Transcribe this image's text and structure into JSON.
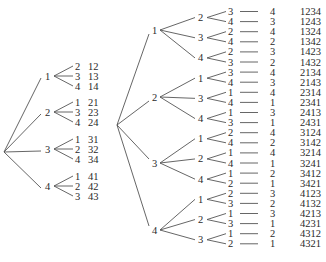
{
  "tree2": {
    "root_children": [
      {
        "label": "1",
        "children": [
          {
            "label": "2",
            "leaf": "12"
          },
          {
            "label": "3",
            "leaf": "13"
          },
          {
            "label": "4",
            "leaf": "14"
          }
        ]
      },
      {
        "label": "2",
        "children": [
          {
            "label": "1",
            "leaf": "21"
          },
          {
            "label": "3",
            "leaf": "23"
          },
          {
            "label": "4",
            "leaf": "24"
          }
        ]
      },
      {
        "label": "3",
        "children": [
          {
            "label": "1",
            "leaf": "31"
          },
          {
            "label": "2",
            "leaf": "32"
          },
          {
            "label": "4",
            "leaf": "34"
          }
        ]
      },
      {
        "label": "4",
        "children": [
          {
            "label": "1",
            "leaf": "41"
          },
          {
            "label": "2",
            "leaf": "42"
          },
          {
            "label": "3",
            "leaf": "43"
          }
        ]
      }
    ]
  },
  "tree4": {
    "root_children": [
      {
        "label": "1",
        "children": [
          {
            "label": "2",
            "children": [
              {
                "label": "3",
                "last": "4",
                "perm": "1234"
              },
              {
                "label": "4",
                "last": "3",
                "perm": "1243"
              }
            ]
          },
          {
            "label": "3",
            "children": [
              {
                "label": "2",
                "last": "4",
                "perm": "1324"
              },
              {
                "label": "4",
                "last": "2",
                "perm": "1342"
              }
            ]
          },
          {
            "label": "4",
            "children": [
              {
                "label": "2",
                "last": "3",
                "perm": "1423"
              },
              {
                "label": "3",
                "last": "2",
                "perm": "1432"
              }
            ]
          }
        ]
      },
      {
        "label": "2",
        "children": [
          {
            "label": "1",
            "children": [
              {
                "label": "3",
                "last": "4",
                "perm": "2134"
              },
              {
                "label": "4",
                "last": "3",
                "perm": "2143"
              }
            ]
          },
          {
            "label": "3",
            "children": [
              {
                "label": "1",
                "last": "4",
                "perm": "2314"
              },
              {
                "label": "4",
                "last": "1",
                "perm": "2341"
              }
            ]
          },
          {
            "label": "4",
            "children": [
              {
                "label": "1",
                "last": "3",
                "perm": "2413"
              },
              {
                "label": "3",
                "last": "1",
                "perm": "2431"
              }
            ]
          }
        ]
      },
      {
        "label": "3",
        "children": [
          {
            "label": "1",
            "children": [
              {
                "label": "2",
                "last": "4",
                "perm": "3124"
              },
              {
                "label": "4",
                "last": "2",
                "perm": "3142"
              }
            ]
          },
          {
            "label": "2",
            "children": [
              {
                "label": "1",
                "last": "4",
                "perm": "3214"
              },
              {
                "label": "4",
                "last": "1",
                "perm": "3241"
              }
            ]
          },
          {
            "label": "4",
            "children": [
              {
                "label": "1",
                "last": "2",
                "perm": "3412"
              },
              {
                "label": "2",
                "last": "1",
                "perm": "3421"
              }
            ]
          }
        ]
      },
      {
        "label": "4",
        "children": [
          {
            "label": "1",
            "children": [
              {
                "label": "2",
                "last": "3",
                "perm": "4123"
              },
              {
                "label": "3",
                "last": "2",
                "perm": "4132"
              }
            ]
          },
          {
            "label": "2",
            "children": [
              {
                "label": "1",
                "last": "3",
                "perm": "4213"
              },
              {
                "label": "3",
                "last": "1",
                "perm": "4231"
              }
            ]
          },
          {
            "label": "3",
            "children": [
              {
                "label": "1",
                "last": "2",
                "perm": "4312"
              },
              {
                "label": "2",
                "last": "1",
                "perm": "4321"
              }
            ]
          }
        ]
      }
    ]
  }
}
